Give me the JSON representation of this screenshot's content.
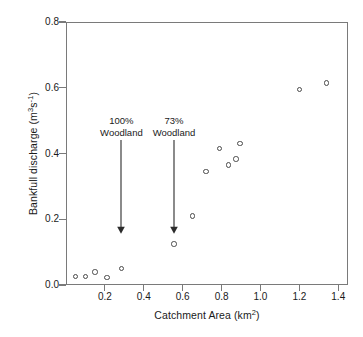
{
  "figure": {
    "background_color": "#ffffff",
    "frame_color": "#7a7a7a",
    "marker_color": "#4a4a4a",
    "text_color": "#1a1a1a"
  },
  "axes": {
    "y_title_main": "Bankfull discharge (m",
    "y_title_sup1": "3",
    "y_title_mid": "s",
    "y_title_sup2": "-1",
    "y_title_end": ")",
    "y_title_full": "Bankfull discharge (m3s-1)",
    "x_title_main": "Catchment Area (km",
    "x_title_sup": "2",
    "x_title_end": ")",
    "x_title_full": "Catchment Area (km2)",
    "x_ticks": [
      "0.2",
      "0.4",
      "0.6",
      "0.8",
      "1.0",
      "1.2",
      "1.4"
    ],
    "y_ticks": [
      "0.0",
      "0.2",
      "0.4",
      "0.6",
      "0.8"
    ]
  },
  "annotations": [
    {
      "line1": "100%",
      "line2": "Woodland",
      "x": 0.285,
      "y_text": 0.48,
      "y_arrow_top": 0.44,
      "y_arrow_tip": 0.155
    },
    {
      "line1": "73%",
      "line2": "Woodland",
      "x": 0.555,
      "y_text": 0.48,
      "y_arrow_top": 0.44,
      "y_arrow_tip": 0.155
    }
  ],
  "chart_data": {
    "type": "scatter",
    "title": "",
    "xlabel": "Catchment Area (km2)",
    "ylabel": "Bankfull discharge (m3s-1)",
    "xlim": [
      0.0,
      1.45
    ],
    "ylim": [
      0.0,
      0.8
    ],
    "xticks": [
      0.2,
      0.4,
      0.6,
      0.8,
      1.0,
      1.2,
      1.4
    ],
    "yticks": [
      0.0,
      0.2,
      0.4,
      0.6,
      0.8
    ],
    "grid": false,
    "legend": false,
    "marker": "open-circle",
    "series": [
      {
        "name": "Catchments",
        "points": [
          {
            "x": 0.05,
            "y": 0.025
          },
          {
            "x": 0.1,
            "y": 0.025
          },
          {
            "x": 0.15,
            "y": 0.04
          },
          {
            "x": 0.21,
            "y": 0.023
          },
          {
            "x": 0.285,
            "y": 0.05
          },
          {
            "x": 0.555,
            "y": 0.125
          },
          {
            "x": 0.65,
            "y": 0.21
          },
          {
            "x": 0.72,
            "y": 0.345
          },
          {
            "x": 0.79,
            "y": 0.415
          },
          {
            "x": 0.835,
            "y": 0.365
          },
          {
            "x": 0.875,
            "y": 0.383
          },
          {
            "x": 0.895,
            "y": 0.43
          },
          {
            "x": 1.2,
            "y": 0.595
          },
          {
            "x": 1.34,
            "y": 0.615
          }
        ]
      }
    ],
    "annotations": [
      {
        "text": "100% Woodland",
        "x": 0.285,
        "points_to_y": 0.05
      },
      {
        "text": "73% Woodland",
        "x": 0.555,
        "points_to_y": 0.125
      }
    ]
  }
}
